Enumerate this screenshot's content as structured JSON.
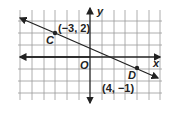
{
  "diagram": {
    "axes": {
      "x_label": "x",
      "y_label": "y",
      "origin_label": "O"
    },
    "grid": {
      "x_min": -6,
      "x_max": 6,
      "y_min": -4,
      "y_max": 4
    },
    "points": [
      {
        "name": "C",
        "coords_label": "(−3, 2)",
        "x": -3,
        "y": 2
      },
      {
        "name": "D",
        "coords_label": "(4, −1)",
        "x": 4,
        "y": -1
      }
    ],
    "line": {
      "through": [
        "C",
        "D"
      ]
    },
    "colors": {
      "grid": "#9a9a9a",
      "line": "#222222"
    }
  }
}
